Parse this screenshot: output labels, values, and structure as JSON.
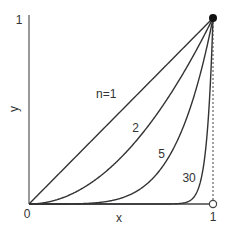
{
  "chart_data": {
    "type": "line",
    "title": "",
    "xlabel": "x",
    "ylabel": "y",
    "xlim": [
      0,
      1
    ],
    "ylim": [
      0,
      1
    ],
    "grid": false,
    "legend": "none (inline curve labels)",
    "function": "y = x^n",
    "x_ticks": [
      "0",
      "1"
    ],
    "y_ticks": [
      "0",
      "1"
    ],
    "series": [
      {
        "name": "n=1",
        "label": "n=1",
        "exponent": 1,
        "label_pos": [
          0.42,
          0.57
        ]
      },
      {
        "name": "n=2",
        "label": "2",
        "exponent": 2,
        "label_pos": [
          0.58,
          0.39
        ]
      },
      {
        "name": "n=5",
        "label": "5",
        "exponent": 5,
        "label_pos": [
          0.72,
          0.25
        ]
      },
      {
        "name": "n=30",
        "label": "30",
        "exponent": 30,
        "label_pos": [
          0.87,
          0.12
        ]
      }
    ],
    "annotations": [
      {
        "type": "filled-point",
        "x": 1,
        "y": 1
      },
      {
        "type": "open-point",
        "x": 1,
        "y": 0
      },
      {
        "type": "dashed-vertical-line",
        "x": 1,
        "from": 0,
        "to": 1
      }
    ]
  },
  "colors": {
    "line": "#333333",
    "axis": "#555555",
    "background": "#ffffff"
  }
}
